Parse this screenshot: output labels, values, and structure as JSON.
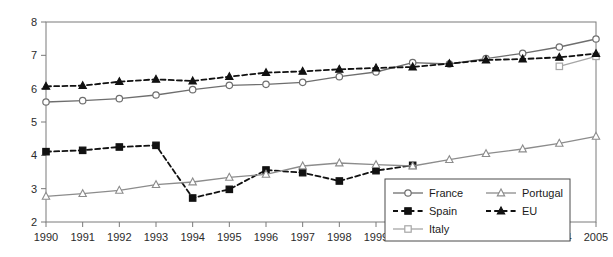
{
  "chart_data": {
    "type": "line",
    "title": "",
    "subtitle": "",
    "xlabel": "",
    "ylabel": "",
    "xlim": [
      1990,
      2005
    ],
    "ylim": [
      2,
      8
    ],
    "yticks": [
      2,
      3,
      4,
      5,
      6,
      7,
      8
    ],
    "grid": false,
    "legend_position": "lower-right",
    "frame": "box",
    "categories": [
      1990,
      1991,
      1992,
      1993,
      1994,
      1995,
      1996,
      1997,
      1998,
      1999,
      2000,
      2001,
      2002,
      2003,
      2004,
      2005
    ],
    "x": [
      "1990",
      "1991",
      "1992",
      "1993",
      "1994",
      "1995",
      "1996",
      "1997",
      "1998",
      "1999",
      "2000",
      "2001",
      "2002",
      "2003",
      "2004",
      "2005"
    ],
    "series": [
      {
        "name": "France",
        "color": "#6e6e6e",
        "line_style": "solid",
        "marker": "open-circle",
        "marker_fill": "#ffffff",
        "values": [
          5.6,
          5.64,
          5.7,
          5.81,
          5.97,
          6.1,
          6.13,
          6.19,
          6.36,
          6.5,
          6.78,
          6.74,
          6.9,
          7.06,
          7.25,
          7.49
        ]
      },
      {
        "name": "Spain",
        "color": "#111111",
        "line_style": "dashed",
        "marker": "filled-square",
        "marker_fill": "#111111",
        "values": [
          4.11,
          4.15,
          4.25,
          4.3,
          2.72,
          2.98,
          3.56,
          3.48,
          3.23,
          3.54,
          3.7,
          null,
          null,
          null,
          null,
          null
        ]
      },
      {
        "name": "Italy",
        "color": "#a6a6a6",
        "line_style": "solid",
        "marker": "open-square",
        "marker_fill": "#ffffff",
        "values": [
          null,
          null,
          null,
          null,
          null,
          null,
          null,
          null,
          null,
          null,
          null,
          null,
          null,
          null,
          6.67,
          6.97
        ]
      },
      {
        "name": "Portugal",
        "color": "#8c8c8c",
        "line_style": "solid",
        "marker": "open-triangle",
        "marker_fill": "#ffffff",
        "values": [
          2.77,
          2.85,
          2.95,
          3.12,
          3.2,
          3.34,
          3.43,
          3.68,
          3.77,
          3.72,
          3.68,
          3.87,
          4.05,
          4.19,
          4.36,
          4.57
        ]
      },
      {
        "name": "EU",
        "color": "#111111",
        "line_style": "dashed",
        "marker": "filled-triangle",
        "marker_fill": "#111111",
        "values": [
          6.07,
          6.09,
          6.21,
          6.28,
          6.23,
          6.36,
          6.48,
          6.52,
          6.58,
          6.62,
          6.65,
          6.75,
          6.86,
          6.89,
          6.94,
          7.05
        ]
      }
    ]
  },
  "axes": {
    "y_tick_labels": [
      "8",
      "7",
      "6",
      "5",
      "4",
      "3",
      "2"
    ],
    "x_tick_labels": [
      "1990",
      "1991",
      "1992",
      "1993",
      "1994",
      "1995",
      "1996",
      "1997",
      "1998",
      "1999",
      "2000",
      "2001",
      "2002",
      "2003",
      "2004",
      "2005"
    ]
  },
  "legend": {
    "entries": [
      {
        "label": "France",
        "series": "France"
      },
      {
        "label": "Portugal",
        "series": "Portugal"
      },
      {
        "label": "Spain",
        "series": "Spain"
      },
      {
        "label": "EU",
        "series": "EU"
      },
      {
        "label": "Italy",
        "series": "Italy"
      }
    ]
  },
  "colors": {
    "frame": "#7a7a7a",
    "background": "#ffffff",
    "text": "#1a1a1a"
  }
}
